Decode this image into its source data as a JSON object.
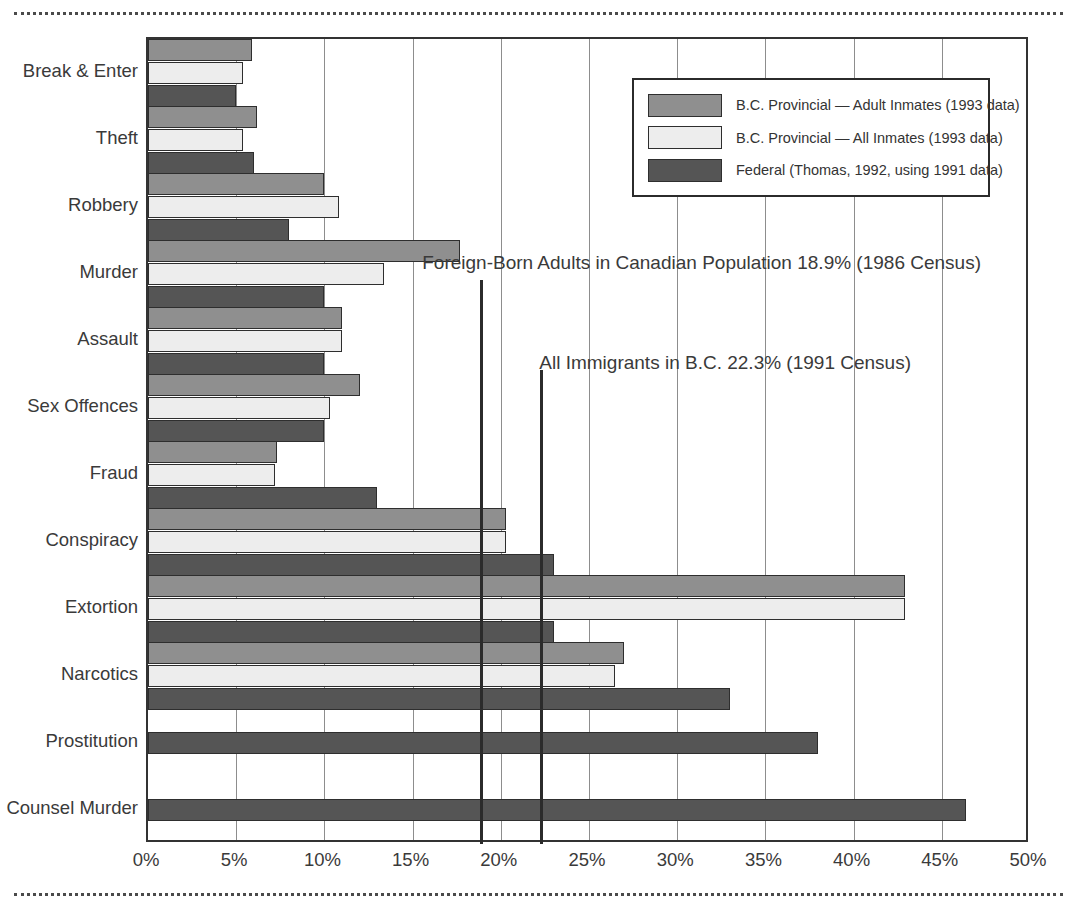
{
  "chart_data": {
    "type": "bar",
    "orientation": "horizontal",
    "title": "",
    "xlabel": "",
    "ylabel": "",
    "xlim": [
      0,
      50
    ],
    "xticks": [
      0,
      5,
      10,
      15,
      20,
      25,
      30,
      35,
      40,
      45,
      50
    ],
    "xtick_labels": [
      "0%",
      "5%",
      "10%",
      "15%",
      "20%",
      "25%",
      "30%",
      "35%",
      "40%",
      "45%",
      "50%"
    ],
    "grid": true,
    "legend_position": "upper right",
    "categories": [
      "Break & Enter",
      "Theft",
      "Robbery",
      "Murder",
      "Assault",
      "Sex Offences",
      "Fraud",
      "Conspiracy",
      "Extortion",
      "Narcotics",
      "Prostitution",
      "Counsel Murder"
    ],
    "series": [
      {
        "name": "B.C. Provincial — Adult Inmates (1993 data)",
        "color": "#8f8f8f",
        "values": [
          5.9,
          6.2,
          10.0,
          17.7,
          11.0,
          12.0,
          7.3,
          20.3,
          42.9,
          27.0,
          null,
          null
        ]
      },
      {
        "name": "B.C. Provincial — All Inmates (1993 data)",
        "color": "#ededed",
        "values": [
          5.4,
          5.4,
          10.8,
          13.4,
          11.0,
          10.3,
          7.2,
          20.3,
          42.9,
          26.5,
          null,
          null
        ]
      },
      {
        "name": "Federal (Thomas, 1992, using 1991 data)",
        "color": "#555555",
        "values": [
          5.0,
          6.0,
          8.0,
          10.0,
          10.0,
          10.0,
          13.0,
          23.0,
          23.0,
          33.0,
          38.0,
          46.4
        ]
      }
    ],
    "reference_lines": [
      {
        "label": "Foreign-Born Adults in Canadian Population 18.9% (1986 Census)",
        "value": 18.9,
        "color": "#2b2b2b"
      },
      {
        "label": "All Immigrants in B.C. 22.3% (1991 Census)",
        "value": 22.3,
        "color": "#2b2b2b"
      }
    ]
  }
}
